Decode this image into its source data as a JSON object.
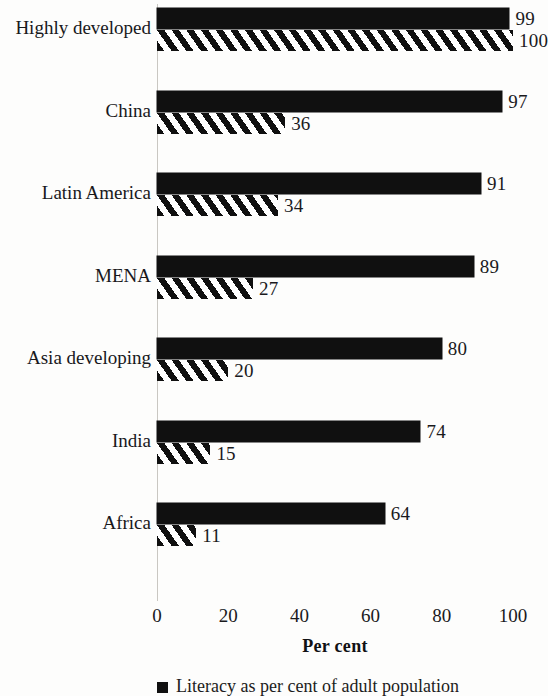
{
  "chart_data": {
    "type": "bar",
    "orientation": "horizontal",
    "title": "",
    "xlabel": "Per cent",
    "ylabel": "",
    "xlim": [
      0,
      100
    ],
    "xticks": [
      "0",
      "20",
      "40",
      "60",
      "80",
      "100"
    ],
    "grid": false,
    "legend_position": "bottom-left",
    "categories": [
      "Highly developed",
      "China",
      "Latin America",
      "MENA",
      "Asia developing",
      "India",
      "Africa"
    ],
    "series": [
      {
        "name": "Literacy as per cent of adult population",
        "style": "solid-black",
        "values": [
          99,
          97,
          91,
          89,
          80,
          74,
          64
        ]
      },
      {
        "name": "",
        "style": "diagonal-hatch",
        "values": [
          100,
          36,
          34,
          27,
          20,
          15,
          11
        ]
      }
    ],
    "legend": [
      {
        "marker": "solid-black-square",
        "label": "Literacy as per cent of adult population"
      }
    ]
  }
}
